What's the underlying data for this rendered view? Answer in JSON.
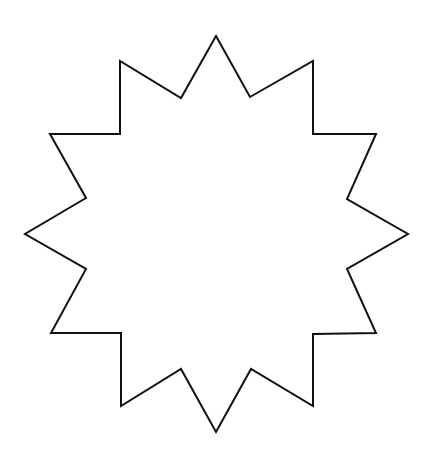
{
  "shape": {
    "type": "twelve-point-star",
    "points": [
      12
    ],
    "stroke": "#111111",
    "fill": "#ffffff",
    "stroke_width": 2,
    "vertices": "216,36 250,97 313,61 313,134 376,134 347,199 408,234 347,269 376,333 313,334 313,406 251,369 216,432 181,369 121,406 121,333 51,333 86,269 25,234 86,198 50,134 120,134 120,61 181,98"
  }
}
